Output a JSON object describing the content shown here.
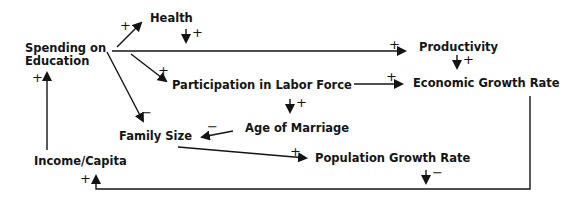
{
  "diagram": {
    "type": "causal-loop",
    "colors": {
      "ink": "#141414",
      "background": "#ffffff"
    },
    "nodes": {
      "spending_line1": "Spending on",
      "spending_line2": "Education",
      "health": "Health",
      "productivity": "Productivity",
      "participation": "Participation in Labor Force",
      "economic_growth": "Economic Growth Rate",
      "age_of_marriage": "Age of Marriage",
      "family_size": "Family Size",
      "population_growth": "Population Growth Rate",
      "income_capita": "Income/Capita"
    },
    "edges": [
      {
        "from": "Spending on Education",
        "to": "Health",
        "sign": "+"
      },
      {
        "from": "Spending on Education",
        "to": "Productivity",
        "sign": "+"
      },
      {
        "from": "Spending on Education",
        "to": "Participation in Labor Force",
        "sign": "+"
      },
      {
        "from": "Spending on Education",
        "to": "Family Size",
        "sign": "−"
      },
      {
        "from": "Health",
        "to": "Productivity",
        "sign": "+"
      },
      {
        "from": "Productivity",
        "to": "Economic Growth Rate",
        "sign": "+"
      },
      {
        "from": "Participation in Labor Force",
        "to": "Economic Growth Rate",
        "sign": "+"
      },
      {
        "from": "Participation in Labor Force",
        "to": "Age of Marriage",
        "sign": "+"
      },
      {
        "from": "Age of Marriage",
        "to": "Family Size",
        "sign": "−"
      },
      {
        "from": "Family Size",
        "to": "Population Growth Rate",
        "sign": "+"
      },
      {
        "from": "Population Growth Rate",
        "to": "Income/Capita",
        "sign": "−"
      },
      {
        "from": "Economic Growth Rate",
        "to": "Income/Capita",
        "sign": "+"
      },
      {
        "from": "Income/Capita",
        "to": "Spending on Education",
        "sign": "+"
      }
    ],
    "signs": {
      "plus": "+",
      "minus": "−"
    }
  }
}
